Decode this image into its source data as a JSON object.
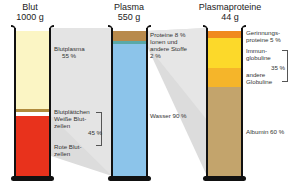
{
  "columns": [
    {
      "title": "Blut",
      "mass": "1000 g",
      "segments": [
        {
          "name": "Blutplasma",
          "color": "#fbf5c4"
        },
        {
          "name": "Blutplättchen",
          "color": "#b08a3c"
        },
        {
          "name": "Weiße Blutzellen",
          "color": "#ffffff"
        },
        {
          "name": "Rote Blutzellen",
          "color": "#e8321c"
        }
      ],
      "labels": {
        "plasma": "Blutplasma",
        "plasma_pct": "55 %",
        "platelets": "Blutplättchen",
        "white1": "Weiße Blut-",
        "white2": "zellen",
        "cells_pct": "45 %",
        "red1": "Rote Blut-",
        "red2": "zellen"
      }
    },
    {
      "title": "Plasma",
      "mass": "550 g",
      "segments": [
        {
          "name": "Proteine",
          "color": "#b88a4c"
        },
        {
          "name": "Ionen und andere Stoffe",
          "color": "#5aa9a8"
        },
        {
          "name": "Wasser",
          "color": "#8cc4ea"
        }
      ],
      "labels": {
        "proteins": "Proteine 8 %",
        "ions1": "Ionen und",
        "ions2": "andere Stoffe",
        "ions_pct": "2 %",
        "water": "Wasser 90 %"
      }
    },
    {
      "title": "Plasmaproteine",
      "mass": "44 g",
      "segments": [
        {
          "name": "Gerinnungsproteine",
          "color": "#f08a1e"
        },
        {
          "name": "Immunglobuline",
          "color": "#fcd92a"
        },
        {
          "name": "andere Globuline",
          "color": "#f5b52a"
        },
        {
          "name": "Albumin",
          "color": "#c3a46c"
        }
      ],
      "labels": {
        "clot1": "Gerinnungs-",
        "clot2": "proteine 5 %",
        "immun1": "Immun-",
        "immun2": "globuline",
        "glob_pct": "35 %",
        "other1": "andere",
        "other2": "Globuline",
        "albumin": "Albumin 60 %"
      }
    }
  ]
}
